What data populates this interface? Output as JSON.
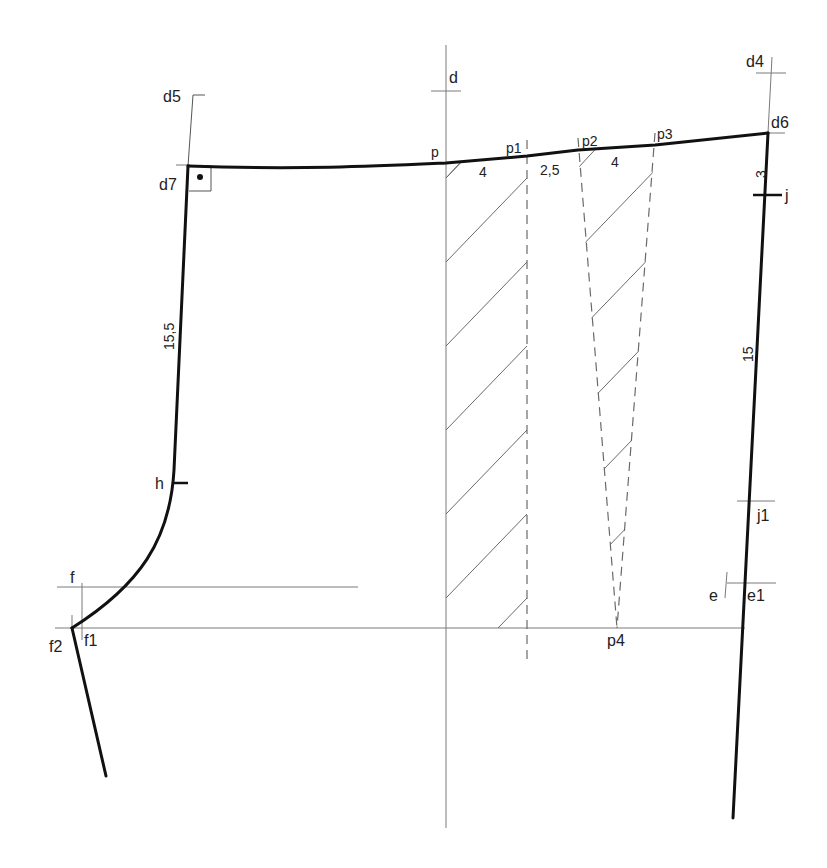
{
  "diagram": {
    "type": "sewing-pattern-draft",
    "colors": {
      "outline": "#111111",
      "guide": "#7a7a7a",
      "hatch": "#6a6a6a",
      "background": "#ffffff"
    },
    "points": {
      "d": "d",
      "d4": "d4",
      "d5": "d5",
      "d6": "d6",
      "d7": "d7",
      "p": "p",
      "p1": "p1",
      "p2": "p2",
      "p3": "p3",
      "p4": "p4",
      "j": "j",
      "j1": "j1",
      "e": "e",
      "e1": "e1",
      "h": "h",
      "f": "f",
      "f1": "f1",
      "f2": "f2"
    },
    "measurements": {
      "p_p1": "4",
      "p1_p2": "2,5",
      "p2_p3": "4",
      "d6_j": "3",
      "j_j1": "15",
      "d7_h": "15,5"
    },
    "symbols": {
      "right_angle_marker": "right-angle-square-with-dot"
    }
  }
}
